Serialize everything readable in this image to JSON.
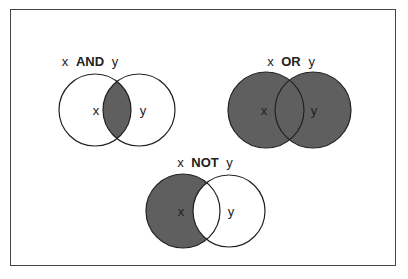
{
  "diagrams": [
    {
      "name": "and",
      "title_left": "x",
      "operator": "AND",
      "title_right": "y",
      "left_label": "x",
      "right_label": "y"
    },
    {
      "name": "or",
      "title_left": "x",
      "operator": "OR",
      "title_right": "y",
      "left_label": "x",
      "right_label": "y"
    },
    {
      "name": "not",
      "title_left": "x",
      "operator": "NOT",
      "title_right": "y",
      "left_label": "x",
      "right_label": "y"
    }
  ],
  "colors": {
    "fill": "#5f5f5f",
    "stroke": "#222222",
    "frame": "#444444"
  }
}
